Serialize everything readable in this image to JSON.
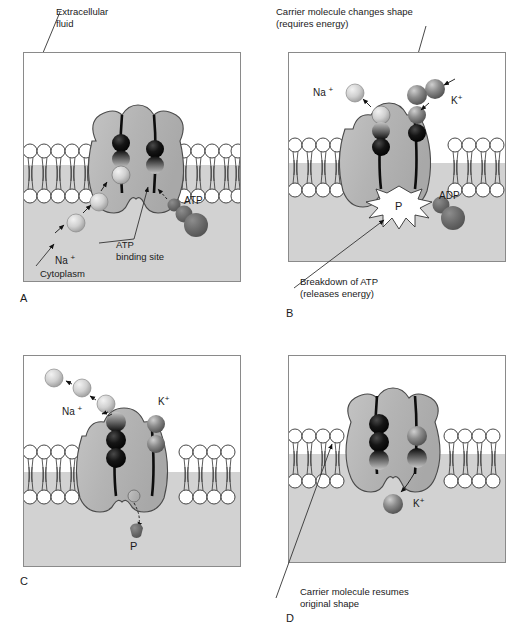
{
  "figure": {
    "type": "biology-diagram"
  },
  "colors": {
    "cytoplasm": "#d2d2d2",
    "extracellular": "#ffffff",
    "carrier_fill": "#b5b5b5",
    "carrier_stroke": "#4a4a4a",
    "membrane_head_fill": "#ffffff",
    "membrane_stroke": "#333333",
    "atp_fill": "#6e6e6e",
    "na_ion": "#c9c9c9",
    "k_ion": "#8f8f8f",
    "dark_sphere": "#111111",
    "frame_border": "#8a8a8a",
    "text": "#1a1a1a"
  },
  "panels": [
    {
      "id": "A",
      "letter": "A",
      "callouts": [
        {
          "name": "extracellular-fluid-label",
          "text_lines": [
            "Extracellular",
            "fluid"
          ]
        },
        {
          "name": "cytoplasm-label",
          "text_lines": [
            "Cytoplasm"
          ]
        },
        {
          "name": "atp-binding-site-label",
          "text_lines": [
            "ATP",
            "binding site"
          ]
        }
      ],
      "ion_labels": [
        {
          "name": "na-label",
          "species": "Na",
          "charge": "+"
        },
        {
          "name": "atp-label",
          "species": "ATP",
          "charge": ""
        }
      ]
    },
    {
      "id": "B",
      "letter": "B",
      "callouts": [
        {
          "name": "carrier-changes-shape-label",
          "text_lines": [
            "Carrier molecule changes shape",
            "(requires energy)"
          ]
        },
        {
          "name": "breakdown-atp-label",
          "text_lines": [
            "Breakdown of ATP",
            "(releases energy)"
          ]
        }
      ],
      "ion_labels": [
        {
          "name": "na-label",
          "species": "Na",
          "charge": "+"
        },
        {
          "name": "k-label",
          "species": "K",
          "charge": "+"
        },
        {
          "name": "adp-label",
          "species": "ADP",
          "charge": ""
        },
        {
          "name": "phosphate-label",
          "species": "P",
          "charge": ""
        }
      ]
    },
    {
      "id": "C",
      "letter": "C",
      "callouts": [],
      "ion_labels": [
        {
          "name": "na-label",
          "species": "Na",
          "charge": "+"
        },
        {
          "name": "k-label",
          "species": "K",
          "charge": "+"
        },
        {
          "name": "phosphate-label",
          "species": "P",
          "charge": ""
        }
      ]
    },
    {
      "id": "D",
      "letter": "D",
      "callouts": [
        {
          "name": "carrier-resumes-shape-label",
          "text_lines": [
            "Carrier molecule resumes",
            "original shape"
          ]
        }
      ],
      "ion_labels": [
        {
          "name": "k-label",
          "species": "K",
          "charge": "+"
        }
      ]
    }
  ],
  "text": {
    "extracellular_line1": "Extracellular",
    "extracellular_line2": "fluid",
    "cytoplasm": "Cytoplasm",
    "atp_binding_line1": "ATP",
    "atp_binding_line2": "binding site",
    "atp": "ATP",
    "adp": "ADP",
    "phosphate": "P",
    "na": "Na",
    "k": "K",
    "plus": "+",
    "carrier_change_line1": "Carrier molecule changes shape",
    "carrier_change_line2": "(requires energy)",
    "breakdown_line1": "Breakdown of ATP",
    "breakdown_line2": "(releases energy)",
    "resumes_line1": "Carrier molecule resumes",
    "resumes_line2": "original shape",
    "letter_a": "A",
    "letter_b": "B",
    "letter_c": "C",
    "letter_d": "D"
  }
}
